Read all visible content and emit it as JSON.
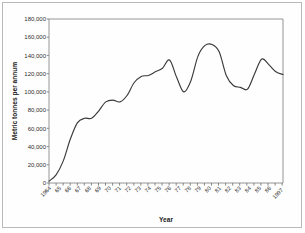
{
  "figure": {
    "background_color": "#ffffff",
    "frame_color": "#b9b9b9",
    "line_color": "#3a3a3a",
    "axis_color": "#6b6b6b"
  },
  "chart_data": {
    "type": "line",
    "title": "",
    "xlabel": "Year",
    "ylabel": "Metric tonnes per annum",
    "xlim": [
      1964,
      1997
    ],
    "ylim": [
      0,
      180000
    ],
    "grid": false,
    "legend": null,
    "ytick_labels": [
      "180,000",
      "160,000",
      "140,000",
      "120,000",
      "100,000",
      "80,000",
      "60,000",
      "40,000",
      "20,000",
      "0"
    ],
    "ytick_values": [
      180000,
      160000,
      140000,
      120000,
      100000,
      80000,
      60000,
      40000,
      20000,
      0
    ],
    "xtick_labels": [
      "1964",
      "65",
      "66",
      "67",
      "68",
      "69",
      "70",
      "71",
      "72",
      "73",
      "74",
      "75",
      "76",
      "77",
      "78",
      "79",
      "80",
      "81",
      "82",
      "83",
      "84",
      "85",
      "86",
      "1997"
    ],
    "x": [
      1964,
      1965,
      1966,
      1967,
      1968,
      1969,
      1970,
      1971,
      1972,
      1973,
      1974,
      1975,
      1976,
      1977,
      1978,
      1979,
      1980,
      1981,
      1982,
      1983,
      1984,
      1985,
      1986,
      1987,
      1988,
      1989,
      1990,
      1991,
      1992,
      1993,
      1994,
      1995,
      1996,
      1997
    ],
    "values": [
      2000,
      9000,
      24000,
      48000,
      66000,
      71000,
      71000,
      79000,
      89000,
      91000,
      89000,
      96000,
      110000,
      117000,
      118000,
      122000,
      126000,
      135000,
      116000,
      100000,
      112000,
      139000,
      151000,
      152000,
      144000,
      118000,
      107000,
      105000,
      103000,
      120000,
      136000,
      130000,
      122000,
      119000
    ],
    "series_values_note": "",
    "series": [
      {
        "name": "Metric tonnes per annum",
        "values": [
          2000,
          9000,
          24000,
          48000,
          66000,
          71000,
          71000,
          79000,
          89000,
          91000,
          89000,
          96000,
          110000,
          117000,
          118000,
          122000,
          126000,
          135000,
          116000,
          100000,
          112000,
          139000,
          151000,
          152000,
          144000,
          118000,
          107000,
          105000,
          103000,
          120000,
          136000,
          130000,
          122000,
          119000
        ]
      }
    ]
  }
}
